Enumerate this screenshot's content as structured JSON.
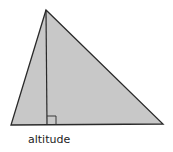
{
  "diagram": {
    "type": "triangle-with-altitude",
    "label": "altitude",
    "fill_color": "#c8c8c8",
    "stroke_color": "#2a2a2a",
    "shapes": [
      "triangle",
      "altitude-line",
      "right-angle-marker"
    ]
  }
}
